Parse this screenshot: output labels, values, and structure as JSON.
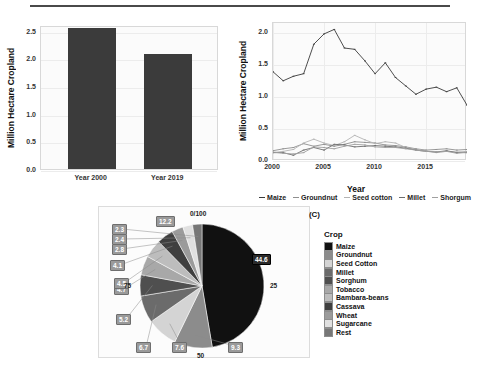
{
  "figure": {
    "panels": [
      "A",
      "B",
      "C"
    ]
  },
  "chart_data": [
    {
      "type": "bar",
      "panel": "(A)",
      "title": "",
      "xlabel": "",
      "ylabel": "Million Hectare Cropland",
      "categories": [
        "Year 2000",
        "Year 2019"
      ],
      "values": [
        2.55,
        2.07
      ],
      "ylim": [
        0.0,
        2.6
      ],
      "yticks": [
        "0.0",
        "0.5",
        "1.0",
        "1.5",
        "2.0",
        "2.5"
      ],
      "ytick_values": [
        0.0,
        0.5,
        1.0,
        1.5,
        2.0,
        2.5
      ],
      "grid": true,
      "bar_color": "#3b3b3b",
      "legend": "none"
    },
    {
      "type": "line",
      "panel": "(B)",
      "title": "",
      "xlabel": "Year",
      "ylabel": "Million Hectare Cropland",
      "x": [
        2000,
        2001,
        2002,
        2003,
        2004,
        2005,
        2006,
        2007,
        2008,
        2009,
        2010,
        2011,
        2012,
        2013,
        2014,
        2015,
        2016,
        2017,
        2018,
        2019
      ],
      "xlim": [
        2000,
        2019
      ],
      "ylim": [
        0.0,
        2.15
      ],
      "xticks": [
        "2000",
        "2005",
        "2010",
        "2015"
      ],
      "xtick_values": [
        2000,
        2005,
        2010,
        2015
      ],
      "yticks": [
        "0.0",
        "0.5",
        "1.0",
        "1.5",
        "2.0"
      ],
      "ytick_values": [
        0.0,
        0.5,
        1.0,
        1.5,
        2.0
      ],
      "grid": true,
      "legend_position": "bottom",
      "series": [
        {
          "name": "Maize",
          "color": "#3a3a3a",
          "values": [
            1.39,
            1.25,
            1.32,
            1.36,
            1.82,
            1.98,
            2.05,
            1.76,
            1.74,
            1.56,
            1.36,
            1.53,
            1.3,
            1.17,
            1.04,
            1.12,
            1.15,
            1.08,
            1.14,
            0.87
          ]
        },
        {
          "name": "Groundnut",
          "color": "#8f8f8f",
          "values": [
            0.16,
            0.19,
            0.21,
            0.27,
            0.23,
            0.26,
            0.23,
            0.26,
            0.3,
            0.29,
            0.28,
            0.25,
            0.24,
            0.22,
            0.19,
            0.17,
            0.18,
            0.19,
            0.17,
            0.18
          ]
        },
        {
          "name": "Seed cotton",
          "color": "#b4b4b4",
          "values": [
            0.13,
            0.15,
            0.18,
            0.28,
            0.34,
            0.28,
            0.24,
            0.3,
            0.4,
            0.33,
            0.27,
            0.3,
            0.28,
            0.21,
            0.18,
            0.16,
            0.13,
            0.15,
            0.14,
            0.15
          ]
        },
        {
          "name": "Millet",
          "color": "#6d6d6d",
          "values": [
            0.13,
            0.13,
            0.09,
            0.17,
            0.21,
            0.17,
            0.26,
            0.25,
            0.22,
            0.23,
            0.24,
            0.23,
            0.22,
            0.2,
            0.17,
            0.15,
            0.14,
            0.16,
            0.13,
            0.13
          ]
        },
        {
          "name": "Shorgum",
          "color": "#a0a0a0",
          "values": [
            0.14,
            0.12,
            0.11,
            0.13,
            0.22,
            0.21,
            0.19,
            0.23,
            0.26,
            0.25,
            0.22,
            0.21,
            0.21,
            0.19,
            0.17,
            0.15,
            0.14,
            0.15,
            0.12,
            0.14
          ]
        }
      ]
    },
    {
      "type": "pie",
      "panel": "(C)",
      "title": "",
      "legend_title": "Crop",
      "legend_position": "right",
      "axis_labels": [
        "0/100",
        "25",
        "50",
        "75"
      ],
      "labels": [
        "Maize",
        "Groundnut",
        "Seed Cotton",
        "Millet",
        "Sorghum",
        "Tobacco",
        "Bambara-beans",
        "Cassava",
        "Wheat",
        "Sugarcane",
        "Rest"
      ],
      "values": [
        44.6,
        9.3,
        7.6,
        6.7,
        5.2,
        4.7,
        4.5,
        4.1,
        2.8,
        2.4,
        2.3
      ],
      "displayed_labels": [
        "44.6",
        "9.3",
        "7.6",
        "6.7",
        "5.2",
        "4.7",
        "4.5",
        "4.1",
        "2.8",
        "2.4",
        "2.3"
      ],
      "rest_label": "12.2",
      "colors": [
        "#111111",
        "#8c8c8c",
        "#d4d4d4",
        "#6b6b6b",
        "#4f4f4f",
        "#a8a8a8",
        "#bdbdbd",
        "#3f3f3f",
        "#9b9b9b",
        "#e0e0e0",
        "#777777"
      ]
    }
  ]
}
